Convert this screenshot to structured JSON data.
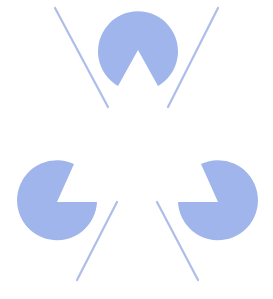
{
  "figure": {
    "colors": {
      "background": "#ffffff",
      "pacman_fill": "#a0b5ec",
      "line_stroke": "#aebdea"
    },
    "pacmen": [
      {
        "name": "top",
        "cx": 137,
        "cy": 48,
        "r": 40,
        "notch_apex": [
          138,
          50
        ],
        "notch_direction": "down"
      },
      {
        "name": "bottom-left",
        "cx": 57,
        "cy": 202,
        "r": 40,
        "notch_apex": [
          57,
          202
        ],
        "notch_direction": "upper-right"
      },
      {
        "name": "bottom-right",
        "cx": 218,
        "cy": 202,
        "r": 40,
        "notch_apex": [
          218,
          202
        ],
        "notch_direction": "upper-left"
      }
    ],
    "lines": [
      {
        "name": "top-left",
        "x1": 55,
        "y1": 8,
        "x2": 108,
        "y2": 107
      },
      {
        "name": "top-right",
        "x1": 218,
        "y1": 8,
        "x2": 168,
        "y2": 107
      },
      {
        "name": "bottom-left",
        "x1": 117,
        "y1": 202,
        "x2": 77,
        "y2": 280
      },
      {
        "name": "bottom-right",
        "x1": 157,
        "y1": 202,
        "x2": 198,
        "y2": 280
      }
    ]
  }
}
